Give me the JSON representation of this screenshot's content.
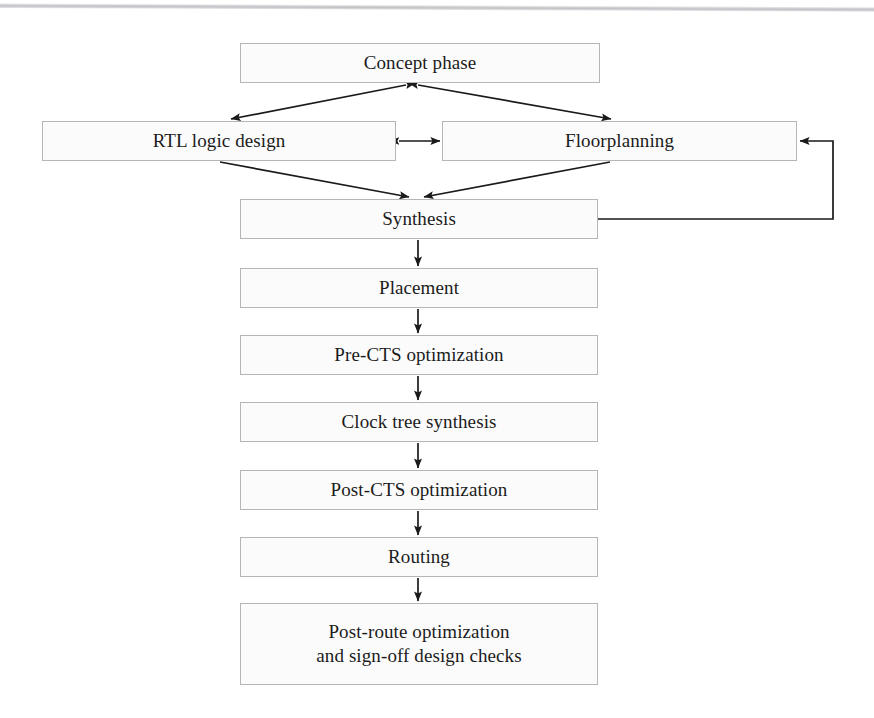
{
  "diagram": {
    "type": "flowchart",
    "orientation": "top-to-bottom",
    "background_color": "#ffffff",
    "node_fill_color": "#fbfbfb",
    "node_border_color": "#b6b6b6",
    "edge_color": "#1a1a1a",
    "nodes": [
      {
        "id": "concept",
        "label": "Concept phase",
        "x": 240,
        "y": 43,
        "w": 360,
        "h": 40
      },
      {
        "id": "rtl",
        "label": "RTL logic design",
        "x": 42,
        "y": 121,
        "w": 354,
        "h": 40
      },
      {
        "id": "floorplan",
        "label": "Floorplanning",
        "x": 442,
        "y": 121,
        "w": 355,
        "h": 40
      },
      {
        "id": "synthesis",
        "label": "Synthesis",
        "x": 240,
        "y": 199,
        "w": 358,
        "h": 40
      },
      {
        "id": "placement",
        "label": "Placement",
        "x": 240,
        "y": 268,
        "w": 358,
        "h": 40
      },
      {
        "id": "prects",
        "label": "Pre-CTS optimization",
        "x": 240,
        "y": 335,
        "w": 358,
        "h": 40
      },
      {
        "id": "cts",
        "label": "Clock tree synthesis",
        "x": 240,
        "y": 402,
        "w": 358,
        "h": 40
      },
      {
        "id": "postcts",
        "label": "Post-CTS optimization",
        "x": 240,
        "y": 470,
        "w": 358,
        "h": 40
      },
      {
        "id": "routing",
        "label": "Routing",
        "x": 240,
        "y": 537,
        "w": 358,
        "h": 40
      },
      {
        "id": "postroute",
        "label": "Post-route optimization\nand sign-off design checks",
        "x": 240,
        "y": 603,
        "w": 358,
        "h": 82
      }
    ],
    "edges": [
      {
        "id": "concept-rtl",
        "from": "concept",
        "to": "rtl",
        "style": "bidirectional-diagonal"
      },
      {
        "id": "concept-floorplan",
        "from": "concept",
        "to": "floorplan",
        "style": "bidirectional-diagonal"
      },
      {
        "id": "rtl-floorplan",
        "from": "rtl",
        "to": "floorplan",
        "style": "bidirectional-horizontal"
      },
      {
        "id": "rtl-synthesis",
        "from": "rtl",
        "to": "synthesis",
        "style": "diagonal-arrow"
      },
      {
        "id": "floorplan-synthesis",
        "from": "floorplan",
        "to": "synthesis",
        "style": "diagonal-arrow"
      },
      {
        "id": "synthesis-floorplan-feedback",
        "from": "synthesis",
        "to": "floorplan",
        "style": "orthogonal-feedback-right"
      },
      {
        "id": "synthesis-placement",
        "from": "synthesis",
        "to": "placement",
        "style": "vertical-arrow"
      },
      {
        "id": "placement-prects",
        "from": "placement",
        "to": "prects",
        "style": "vertical-arrow"
      },
      {
        "id": "prects-cts",
        "from": "prects",
        "to": "cts",
        "style": "vertical-arrow"
      },
      {
        "id": "cts-postcts",
        "from": "cts",
        "to": "postcts",
        "style": "vertical-arrow"
      },
      {
        "id": "postcts-routing",
        "from": "postcts",
        "to": "routing",
        "style": "vertical-arrow"
      },
      {
        "id": "routing-postroute",
        "from": "routing",
        "to": "postroute",
        "style": "vertical-arrow"
      }
    ]
  }
}
